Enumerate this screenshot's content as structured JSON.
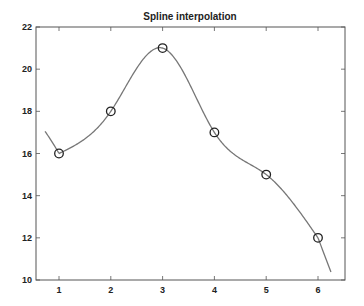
{
  "chart_data": {
    "type": "line",
    "title": "Spline interpolation",
    "xlabel": "",
    "ylabel": "",
    "xlim": [
      0.73,
      6.3
    ],
    "ylim": [
      10,
      22
    ],
    "grid": false,
    "legend": null,
    "x_ticks": [
      1,
      2,
      3,
      4,
      5,
      6
    ],
    "y_ticks": [
      10,
      12,
      14,
      16,
      18,
      20,
      22
    ],
    "series": [
      {
        "name": "data points",
        "style": "markers",
        "marker": "circle",
        "color": "#222222",
        "x": [
          1,
          2,
          3,
          4,
          5,
          6
        ],
        "y": [
          16,
          18,
          21,
          17,
          15,
          12
        ]
      },
      {
        "name": "spline",
        "style": "line",
        "color": "#777777",
        "x_range": [
          0.73,
          6.25
        ],
        "note": "smooth cubic spline through data points, extrapolated at both ends (~17.2 at x=0.73, ~10.4 at x=6.25)"
      }
    ]
  }
}
